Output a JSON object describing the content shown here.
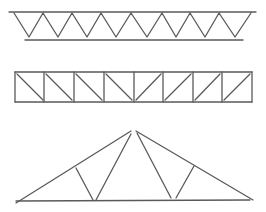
{
  "diagram": {
    "type": "truss-types",
    "stroke_color": "#5a5a5a",
    "background": "#ffffff",
    "trusses": [
      {
        "id": "warren-truss",
        "top_chord": [
          9,
          12,
          256,
          12
        ],
        "bottom_chord": [
          25,
          40,
          243,
          40
        ],
        "zigzag": [
          [
            14,
            13
          ],
          [
            29,
            37
          ],
          [
            43,
            13
          ],
          [
            58,
            37
          ],
          [
            72,
            13
          ],
          [
            87,
            37
          ],
          [
            101,
            13
          ],
          [
            116,
            37
          ],
          [
            131,
            13
          ],
          [
            147,
            37
          ],
          [
            162,
            13
          ],
          [
            176,
            37
          ],
          [
            190,
            13
          ],
          [
            205,
            37
          ],
          [
            219,
            13
          ],
          [
            235,
            37
          ],
          [
            251,
            13
          ]
        ]
      },
      {
        "id": "pratt-truss",
        "top_chord": [
          15,
          72,
          252,
          72
        ],
        "bottom_chord": [
          15,
          102,
          252,
          102
        ],
        "verticals_x": [
          15,
          44,
          74,
          104,
          134,
          163,
          193,
          222,
          252
        ],
        "diagonals": [
          [
            17,
            74,
            43,
            100
          ],
          [
            46,
            74,
            72,
            100
          ],
          [
            76,
            74,
            102,
            100
          ],
          [
            106,
            74,
            132,
            100
          ],
          [
            136,
            100,
            161,
            74
          ],
          [
            165,
            100,
            191,
            74
          ],
          [
            195,
            100,
            220,
            74
          ],
          [
            224,
            100,
            250,
            74
          ]
        ]
      },
      {
        "id": "fink-truss",
        "left_rafter": [
          16,
          203,
          131,
          131
        ],
        "right_rafter": [
          136,
          131,
          253,
          200
        ],
        "bottom_chord": [
          16,
          201,
          250,
          200
        ],
        "webs": [
          [
            76,
            168,
            93,
            200
          ],
          [
            96,
            200,
            131,
            134
          ],
          [
            137,
            133,
            171,
            198
          ],
          [
            176,
            198,
            194,
            166
          ]
        ]
      }
    ]
  }
}
